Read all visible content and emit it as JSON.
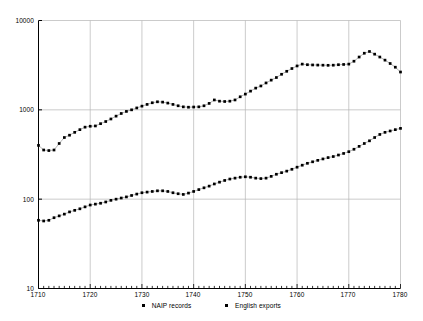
{
  "chart_data": {
    "type": "scatter",
    "title": "",
    "xlabel": "",
    "ylabel": "",
    "yscale": "log",
    "ylim": [
      10,
      10000
    ],
    "xlim": [
      1710,
      1780
    ],
    "grid": true,
    "legend_position": "bottom",
    "y_ticks": [
      "10",
      "100",
      "1000",
      "10000"
    ],
    "y_tick_values": [
      10,
      100,
      1000,
      10000
    ],
    "x_ticks": [
      "1710",
      "1720",
      "1730",
      "1740",
      "1750",
      "1760",
      "1770",
      "1780"
    ],
    "x_tick_values": [
      1710,
      1720,
      1730,
      1740,
      1750,
      1760,
      1770,
      1780
    ],
    "x": [
      1710,
      1711,
      1712,
      1713,
      1714,
      1715,
      1716,
      1717,
      1718,
      1719,
      1720,
      1721,
      1722,
      1723,
      1724,
      1725,
      1726,
      1727,
      1728,
      1729,
      1730,
      1731,
      1732,
      1733,
      1734,
      1735,
      1736,
      1737,
      1738,
      1739,
      1740,
      1741,
      1742,
      1743,
      1744,
      1745,
      1746,
      1747,
      1748,
      1749,
      1750,
      1751,
      1752,
      1753,
      1754,
      1755,
      1756,
      1757,
      1758,
      1759,
      1760,
      1761,
      1762,
      1763,
      1764,
      1765,
      1766,
      1767,
      1768,
      1769,
      1770,
      1771,
      1772,
      1773,
      1774,
      1775,
      1776,
      1777,
      1778,
      1779,
      1780
    ],
    "series": [
      {
        "name": "NAIP records",
        "marker": "square",
        "color": "#000000",
        "values": [
          58,
          57,
          58,
          62,
          65,
          68,
          72,
          75,
          78,
          82,
          86,
          88,
          90,
          93,
          97,
          100,
          103,
          106,
          110,
          114,
          118,
          120,
          122,
          124,
          124,
          122,
          118,
          115,
          113,
          117,
          122,
          128,
          134,
          140,
          148,
          155,
          162,
          168,
          172,
          176,
          178,
          176,
          172,
          170,
          172,
          180,
          190,
          198,
          206,
          216,
          228,
          240,
          252,
          262,
          272,
          282,
          292,
          300,
          312,
          325,
          340,
          362,
          390,
          420,
          450,
          490,
          530,
          560,
          580,
          600,
          620
        ]
      },
      {
        "name": "English exports",
        "marker": "square",
        "color": "#000000",
        "values": [
          400,
          355,
          350,
          355,
          420,
          490,
          520,
          560,
          600,
          640,
          655,
          660,
          700,
          740,
          790,
          850,
          910,
          960,
          1000,
          1050,
          1100,
          1150,
          1200,
          1230,
          1220,
          1190,
          1150,
          1110,
          1080,
          1070,
          1075,
          1080,
          1110,
          1180,
          1290,
          1250,
          1240,
          1250,
          1290,
          1400,
          1500,
          1620,
          1750,
          1850,
          2000,
          2150,
          2300,
          2500,
          2700,
          2900,
          3100,
          3250,
          3200,
          3180,
          3170,
          3160,
          3150,
          3160,
          3200,
          3220,
          3250,
          3500,
          3900,
          4300,
          4500,
          4200,
          3900,
          3600,
          3300,
          3000,
          2650
        ]
      }
    ]
  },
  "legend": {
    "entries": [
      {
        "label": "NAIP records"
      },
      {
        "label": "English exports"
      }
    ]
  },
  "colors": {
    "series": "#000000",
    "grid": "#b4b4b4",
    "axis": "#000000",
    "background": "#ffffff"
  }
}
